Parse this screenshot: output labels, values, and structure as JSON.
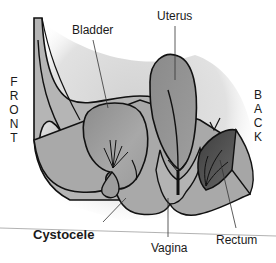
{
  "diagram": {
    "title": "Cystocele",
    "orientation": {
      "front": "FRONT",
      "back": "BACK"
    },
    "labels": {
      "bladder": "Bladder",
      "uterus": "Uterus",
      "cystocele": "Cystocele",
      "vagina": "Vagina",
      "rectum": "Rectum"
    },
    "colors": {
      "background": "#ffffff",
      "outline": "#111111",
      "tissue_light": "#bdbdbd",
      "tissue_mid": "#9a9a9a",
      "organ_fill": "#8f8f8f",
      "rectum_dark": "#4a4a4a",
      "shadow": "#d6d6d6",
      "leader_line": "#333333"
    }
  }
}
